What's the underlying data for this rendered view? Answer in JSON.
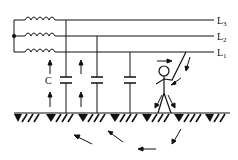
{
  "diagram": {
    "type": "circuit",
    "lines": [
      {
        "id": "L3",
        "label": "L",
        "sub": "3",
        "y": 20
      },
      {
        "id": "L2",
        "label": "L",
        "sub": "2",
        "y": 36
      },
      {
        "id": "L1",
        "label": "L",
        "sub": "1",
        "y": 52
      }
    ],
    "capacitance_label": "C",
    "capacitor_drops_x": [
      66,
      97,
      130
    ],
    "ground_y": 113,
    "colors": {
      "ink": "#111111",
      "background": "#ffffff"
    }
  }
}
